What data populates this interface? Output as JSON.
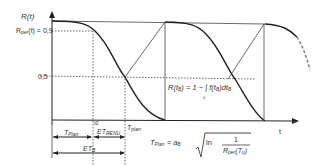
{
  "axes": {
    "y_label": "R(t)",
    "x_label": "t",
    "y_tick_09": "R",
    "y_tick_09_sub": "per",
    "y_tick_09_rest": "(t) = 0,9",
    "y_tick_05": "0,5"
  },
  "points": {
    "t0": "t0"
  },
  "intervals": {
    "t_plan_left": "T",
    "t_plan_left_sub": "Plan",
    "et_renu": "ET",
    "et_renu_sub": "RENU",
    "t_plan_mid": "T",
    "t_plan_mid_sub": "plan",
    "et_b": "ET",
    "et_b_sub": "B"
  },
  "formulas": {
    "reliability": "R(t",
    "reliability_sub": "B",
    "reliability_rest": ") = 1 − ∫ f(t",
    "reliability_tail": ")dt",
    "integral_lower": "0",
    "integral_upper": "t",
    "t_plan": "T",
    "t_plan_sub": "Plan",
    "t_plan_eq": " = a",
    "t_plan_a_sub": "B",
    "t_plan_ln": "ln",
    "t_plan_num": "1",
    "t_plan_den": "R",
    "t_plan_den_sub": "per",
    "t_plan_den_arg": "(T",
    "t_plan_den_arg_sub": "u",
    "t_plan_den_close": ")"
  },
  "colors": {
    "line": "#222222",
    "dotted": "#444444",
    "dashed": "#777777"
  }
}
